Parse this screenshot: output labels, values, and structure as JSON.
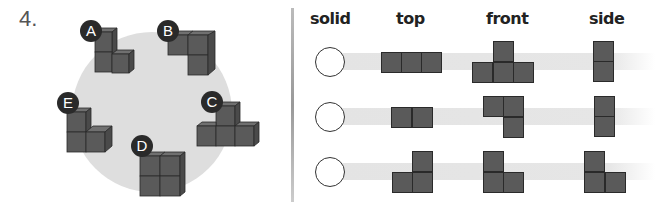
{
  "question_number": "4.",
  "colors": {
    "cube_face": "#5a5a5a",
    "cube_edge": "#2a2a2a",
    "backdrop": "#dedede",
    "band": "#e6e6e6",
    "badge": "#2a2a2a"
  },
  "solids": [
    {
      "label": "A"
    },
    {
      "label": "B"
    },
    {
      "label": "C"
    },
    {
      "label": "D"
    },
    {
      "label": "E"
    }
  ],
  "table": {
    "headers": {
      "solid": "solid",
      "top": "top",
      "front": "front",
      "side": "side"
    },
    "rows": [
      {
        "answer": "",
        "top_cells": [
          [
            0,
            0
          ],
          [
            1,
            0
          ],
          [
            2,
            0
          ]
        ],
        "front_cells": [
          [
            1,
            0
          ],
          [
            0,
            1
          ],
          [
            1,
            1
          ],
          [
            2,
            1
          ]
        ],
        "side_cells": [
          [
            0,
            0
          ],
          [
            0,
            1
          ]
        ]
      },
      {
        "answer": "",
        "top_cells": [
          [
            0,
            0
          ],
          [
            1,
            0
          ]
        ],
        "front_cells": [
          [
            0,
            0
          ],
          [
            1,
            0
          ],
          [
            1,
            1
          ]
        ],
        "side_cells": [
          [
            0,
            0
          ],
          [
            0,
            1
          ]
        ]
      },
      {
        "answer": "",
        "top_cells": [
          [
            1,
            0
          ],
          [
            0,
            1
          ],
          [
            1,
            1
          ]
        ],
        "front_cells": [
          [
            0,
            0
          ],
          [
            0,
            1
          ],
          [
            1,
            1
          ]
        ],
        "side_cells": [
          [
            0,
            0
          ],
          [
            0,
            1
          ],
          [
            1,
            1
          ]
        ]
      }
    ]
  }
}
